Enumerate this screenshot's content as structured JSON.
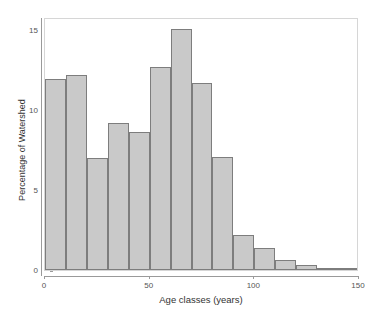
{
  "chart_data": {
    "type": "bar",
    "title": "",
    "subtitle": "",
    "xlabel": "Age classes (years)",
    "ylabel": "Percentage of Watershed",
    "xlim": [
      0,
      150
    ],
    "ylim": [
      0,
      15.8
    ],
    "xticks": [
      0,
      50,
      100,
      150
    ],
    "xtick_labels": [
      "0",
      "50",
      "100",
      "150"
    ],
    "yticks": [
      0,
      5,
      10,
      15
    ],
    "ytick_labels": [
      "0",
      "5",
      "10",
      "15"
    ],
    "grid": false,
    "legend": null,
    "bin_width": 10,
    "bin_edges": [
      0,
      10,
      20,
      30,
      40,
      50,
      60,
      70,
      80,
      90,
      100,
      110,
      120,
      130,
      140,
      150
    ],
    "categories": [
      "0-10",
      "10-20",
      "20-30",
      "30-40",
      "40-50",
      "50-60",
      "60-70",
      "70-80",
      "80-90",
      "90-100",
      "100-110",
      "110-120",
      "120-130",
      "130-140",
      "140-150"
    ],
    "values": [
      11.9,
      12.2,
      7.0,
      9.15,
      8.65,
      12.7,
      15.05,
      11.7,
      7.05,
      2.2,
      1.4,
      0.6,
      0.3,
      0.1,
      0.05
    ],
    "bar_fill_color": "#c9c9c9",
    "bar_border_color": "#7d7d7d",
    "panel_border_color": "#d6d6d6",
    "axis_color": "#9a9a9a",
    "background_color": "#ffffff"
  },
  "axis": {
    "x_title": "Age classes (years)",
    "y_title": "Percentage of Watershed"
  }
}
